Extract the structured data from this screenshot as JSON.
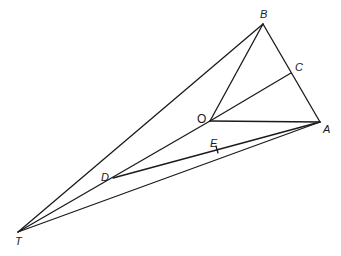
{
  "diagram": {
    "points": {
      "B": {
        "label": "B",
        "x": 263,
        "y": 24,
        "lx": 260,
        "ly": 18
      },
      "C": {
        "label": "C",
        "x": 291,
        "y": 73,
        "lx": 295,
        "ly": 71
      },
      "O": {
        "label": "O",
        "x": 210,
        "y": 121,
        "lx": 197,
        "ly": 123
      },
      "A": {
        "label": "A",
        "x": 320,
        "y": 122,
        "lx": 323,
        "ly": 133
      },
      "E": {
        "label": "E",
        "x": 217,
        "y": 150,
        "lx": 210,
        "ly": 147
      },
      "D": {
        "label": "D",
        "x": 113,
        "y": 178,
        "lx": 101,
        "ly": 181
      },
      "T": {
        "label": "T",
        "x": 18,
        "y": 232,
        "lx": 15,
        "ly": 245
      }
    },
    "segments": [
      [
        "T",
        "B"
      ],
      [
        "B",
        "A"
      ],
      [
        "B",
        "O"
      ],
      [
        "O",
        "C"
      ],
      [
        "O",
        "A"
      ],
      [
        "T",
        "O"
      ],
      [
        "D",
        "A"
      ],
      [
        "T",
        "A"
      ]
    ],
    "tick_marks": [
      "E"
    ]
  }
}
